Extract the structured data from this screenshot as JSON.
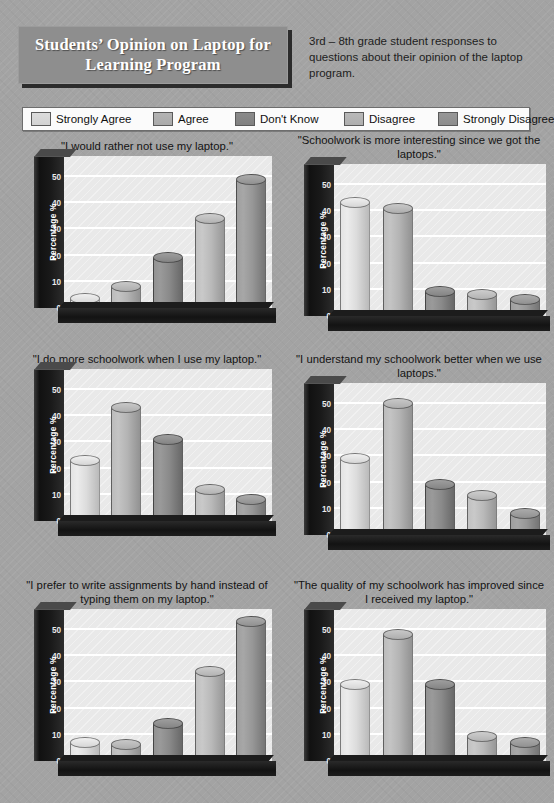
{
  "header": {
    "title": "Students’ Opinion on Laptop for Learning Program",
    "subtitle": "3rd – 8th grade student responses to questions about their opinion of the laptop program."
  },
  "legend": {
    "items": [
      {
        "label": "Strongly Agree",
        "color": "#dcdcdc"
      },
      {
        "label": "Agree",
        "color": "#b4b4b4"
      },
      {
        "label": "Don't Know",
        "color": "#8a8a8a"
      },
      {
        "label": "Disagree",
        "color": "#b9b9b9"
      },
      {
        "label": "Strongly Disagree",
        "color": "#979797"
      }
    ]
  },
  "axis": {
    "ylabel": "Percentage %",
    "ticks": [
      "0",
      "10",
      "20",
      "30",
      "40",
      "50"
    ],
    "ymax": 58
  },
  "chart_data": [
    {
      "type": "bar",
      "title": "\"I would rather not use my laptop.\"",
      "categories": [
        "Strongly Agree",
        "Agree",
        "Don't Know",
        "Disagree",
        "Strongly Disagree"
      ],
      "values": [
        3,
        8,
        19,
        34,
        49
      ],
      "xlabel": "",
      "ylabel": "Percentage %",
      "ylim": [
        0,
        58
      ],
      "grid": true
    },
    {
      "type": "bar",
      "title": "\"Schoolwork is more interesting since we got the laptops.\"",
      "categories": [
        "Strongly Agree",
        "Agree",
        "Don't Know",
        "Disagree",
        "Strongly Disagree"
      ],
      "values": [
        43,
        41,
        9,
        8,
        6
      ],
      "xlabel": "",
      "ylabel": "Percentage %",
      "ylim": [
        0,
        58
      ],
      "grid": true
    },
    {
      "type": "bar",
      "title": "\"I do more schoolwork when I use my laptop.\"",
      "categories": [
        "Strongly Agree",
        "Agree",
        "Don't Know",
        "Disagree",
        "Strongly Disagree"
      ],
      "values": [
        23,
        43,
        31,
        12,
        8
      ],
      "xlabel": "",
      "ylabel": "Percentage %",
      "ylim": [
        0,
        58
      ],
      "grid": true
    },
    {
      "type": "bar",
      "title": "\"I understand my schoolwork better when we use laptops.\"",
      "categories": [
        "Strongly Agree",
        "Agree",
        "Don't Know",
        "Disagree",
        "Strongly Disagree"
      ],
      "values": [
        29,
        50,
        19,
        15,
        8
      ],
      "xlabel": "",
      "ylabel": "Percentage %",
      "ylim": [
        0,
        58
      ],
      "grid": true
    },
    {
      "type": "bar",
      "title": "\"I prefer to write assignments by hand instead of typing them on my laptop.\"",
      "categories": [
        "Strongly Agree",
        "Agree",
        "Don't Know",
        "Disagree",
        "Strongly Disagree"
      ],
      "values": [
        7,
        6,
        14,
        34,
        53
      ],
      "xlabel": "",
      "ylabel": "Percentage %",
      "ylim": [
        0,
        58
      ],
      "grid": true
    },
    {
      "type": "bar",
      "title": "\"The quality of my schoolwork has improved since I received my laptop.\"",
      "categories": [
        "Strongly Agree",
        "Agree",
        "Don't Know",
        "Disagree",
        "Strongly Disagree"
      ],
      "values": [
        29,
        48,
        29,
        9,
        7
      ],
      "xlabel": "",
      "ylabel": "Percentage %",
      "ylim": [
        0,
        58
      ],
      "grid": true
    }
  ]
}
